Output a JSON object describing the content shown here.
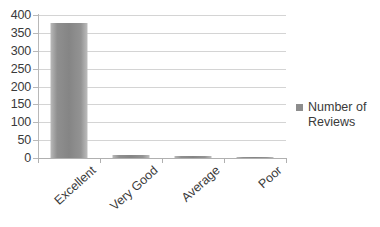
{
  "chart_data": {
    "type": "bar",
    "title": "",
    "subtitle": "",
    "xlabel": "",
    "ylabel": "",
    "categories": [
      "Excellent",
      "Very Good",
      "Average",
      "Poor"
    ],
    "series": [
      {
        "name": "Number of Reviews",
        "values": [
          378,
          8,
          5,
          2
        ],
        "color": "#8d8d8d"
      }
    ],
    "values": [
      378,
      8,
      5,
      2
    ],
    "ylim": [
      0,
      400
    ],
    "ytick_step": 50,
    "yticks": [
      400,
      350,
      300,
      250,
      200,
      150,
      100,
      50,
      0
    ],
    "ytick_labels": [
      "400",
      "350",
      "300",
      "250",
      "200",
      "150",
      "100",
      "50",
      "0"
    ],
    "grid": true,
    "grid_axis": "y",
    "legend_position": "right",
    "legend_entries": [
      "Number of Reviews"
    ],
    "annotations": []
  },
  "legend": {
    "entry_line1": "Number of",
    "entry_line2": "Reviews",
    "swatch_name": "legend-color-swatch"
  },
  "colors": {
    "bar_fill": "#8d8d8d",
    "gridline": "#d4d4d4",
    "axis_line": "#b0b0b0",
    "text": "#3a3a3a",
    "background": "#ffffff"
  }
}
